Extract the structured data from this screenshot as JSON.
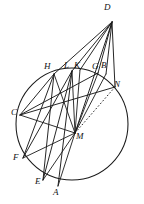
{
  "figure": {
    "canvas": {
      "width": 144,
      "height": 204
    },
    "ink_color": "#1a1a1a",
    "background_color": "#ffffff",
    "circle": {
      "cx": 72,
      "cy": 124,
      "r": 56,
      "label": "main-circle"
    },
    "points": [
      {
        "id": "D",
        "label": "D",
        "x": 112,
        "y": 22,
        "label_x": 104,
        "label_y": 3,
        "on_circle": false,
        "role": "external-apex"
      },
      {
        "id": "H",
        "label": "H",
        "x": 54,
        "y": 74,
        "label_x": 44,
        "label_y": 62,
        "on_circle": true,
        "role": "circle-point"
      },
      {
        "id": "L",
        "label": "L",
        "x": 72,
        "y": 71,
        "label_x": 64,
        "label_y": 61,
        "on_circle": true,
        "role": "circle-point"
      },
      {
        "id": "K",
        "label": "K",
        "x": 80,
        "y": 70,
        "label_x": 74,
        "label_y": 61,
        "on_circle": true,
        "role": "circle-point"
      },
      {
        "id": "G",
        "label": "G",
        "x": 98,
        "y": 73,
        "label_x": 92,
        "label_y": 62,
        "on_circle": true,
        "role": "circle-point"
      },
      {
        "id": "B",
        "label": "B",
        "x": 106,
        "y": 74,
        "label_x": 101,
        "label_y": 61,
        "on_circle": true,
        "role": "circle-point"
      },
      {
        "id": "N",
        "label": "N",
        "x": 115,
        "y": 87,
        "label_x": 114,
        "label_y": 80,
        "on_circle": true,
        "role": "circle-point"
      },
      {
        "id": "C",
        "label": "C",
        "x": 20,
        "y": 115,
        "label_x": 11,
        "label_y": 108,
        "on_circle": true,
        "role": "circle-point"
      },
      {
        "id": "M",
        "label": "M",
        "x": 75,
        "y": 133,
        "label_x": 76,
        "label_y": 132,
        "on_circle": false,
        "role": "hub-center"
      },
      {
        "id": "F",
        "label": "F",
        "x": 23,
        "y": 158,
        "label_x": 13,
        "label_y": 153,
        "on_circle": true,
        "role": "circle-point"
      },
      {
        "id": "E",
        "label": "E",
        "x": 43,
        "y": 180,
        "label_x": 35,
        "label_y": 177,
        "on_circle": true,
        "role": "circle-point"
      },
      {
        "id": "A",
        "label": "A",
        "x": 58,
        "y": 186,
        "label_x": 53,
        "label_y": 188,
        "on_circle": true,
        "role": "circle-point"
      }
    ],
    "segments": [
      {
        "name": "D-to-H",
        "from": "D",
        "to": "H",
        "style": "solid",
        "kind": "ray"
      },
      {
        "name": "D-to-L",
        "from": "D",
        "to": "L",
        "style": "solid",
        "kind": "ray"
      },
      {
        "name": "D-to-K",
        "from": "D",
        "to": "K",
        "style": "solid",
        "kind": "ray"
      },
      {
        "name": "D-to-M",
        "from": "D",
        "to": "M",
        "style": "solid",
        "kind": "ray"
      },
      {
        "name": "D-to-G",
        "from": "D",
        "to": "G",
        "style": "solid",
        "kind": "ray"
      },
      {
        "name": "D-to-B",
        "from": "D",
        "to": "B",
        "style": "solid",
        "kind": "ray"
      },
      {
        "name": "D-to-N",
        "from": "D",
        "to": "N",
        "style": "solid",
        "kind": "ray"
      },
      {
        "name": "M-to-H",
        "from": "M",
        "to": "H",
        "style": "solid",
        "kind": "spoke"
      },
      {
        "name": "M-to-L",
        "from": "M",
        "to": "L",
        "style": "solid",
        "kind": "spoke"
      },
      {
        "name": "M-to-K",
        "from": "M",
        "to": "K",
        "style": "solid",
        "kind": "spoke"
      },
      {
        "name": "M-to-G",
        "from": "M",
        "to": "G",
        "style": "solid",
        "kind": "spoke"
      },
      {
        "name": "M-to-B",
        "from": "M",
        "to": "B",
        "style": "solid",
        "kind": "spoke"
      },
      {
        "name": "M-to-C",
        "from": "M",
        "to": "C",
        "style": "solid",
        "kind": "spoke"
      },
      {
        "name": "M-to-F",
        "from": "M",
        "to": "F",
        "style": "solid",
        "kind": "spoke"
      },
      {
        "name": "M-to-E",
        "from": "M",
        "to": "E",
        "style": "solid",
        "kind": "spoke"
      },
      {
        "name": "M-to-A",
        "from": "M",
        "to": "A",
        "style": "solid",
        "kind": "spoke"
      },
      {
        "name": "M-to-N-dotted",
        "from": "M",
        "to": "N",
        "style": "dotted",
        "kind": "spoke"
      },
      {
        "name": "chord-C-to-H",
        "from": "C",
        "to": "H",
        "style": "solid",
        "kind": "chord"
      },
      {
        "name": "chord-C-to-N",
        "from": "C",
        "to": "N",
        "style": "solid",
        "kind": "chord"
      },
      {
        "name": "chord-F-to-H",
        "from": "F",
        "to": "H",
        "style": "solid",
        "kind": "chord"
      },
      {
        "name": "chord-F-to-L",
        "from": "F",
        "to": "L",
        "style": "solid",
        "kind": "chord"
      },
      {
        "name": "chord-E-to-H",
        "from": "E",
        "to": "H",
        "style": "solid",
        "kind": "chord"
      },
      {
        "name": "chord-A-to-L",
        "from": "A",
        "to": "L",
        "style": "solid",
        "kind": "chord"
      },
      {
        "name": "chord-E-to-L",
        "from": "E",
        "to": "L",
        "style": "solid",
        "kind": "chord"
      },
      {
        "name": "chord-C-to-G",
        "from": "C",
        "to": "G",
        "style": "solid",
        "kind": "chord"
      }
    ]
  }
}
